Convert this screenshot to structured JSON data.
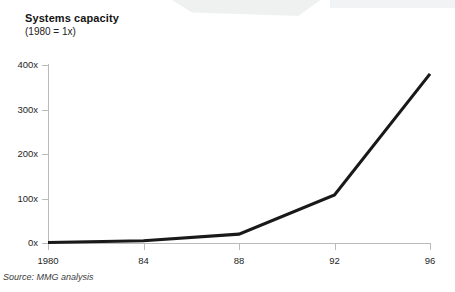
{
  "chart_data": {
    "type": "line",
    "title": "Systems capacity",
    "subtitle": "(1980 = 1x)",
    "xlabel": "",
    "ylabel": "",
    "x": [
      1980,
      1984,
      1988,
      1992,
      1996
    ],
    "categories": [
      "1980",
      "84",
      "88",
      "92",
      "96"
    ],
    "values": [
      1,
      5,
      20,
      108,
      380
    ],
    "series": [
      {
        "name": "Systems capacity",
        "values": [
          1,
          5,
          20,
          108,
          380
        ]
      }
    ],
    "xlim": [
      1980,
      1996
    ],
    "ylim": [
      0,
      400
    ],
    "ytick_values": [
      0,
      100,
      200,
      300,
      400
    ],
    "ytick_labels": [
      "0x",
      "100x",
      "200x",
      "300x",
      "400x"
    ],
    "xtick_labels": [
      "1980",
      "84",
      "88",
      "92",
      "96"
    ],
    "grid": false,
    "legend": false,
    "line_color": "#191919",
    "axis_color": "#b9bcbd",
    "annotations": []
  },
  "footer": {
    "source": "Source: MMG analysis"
  }
}
